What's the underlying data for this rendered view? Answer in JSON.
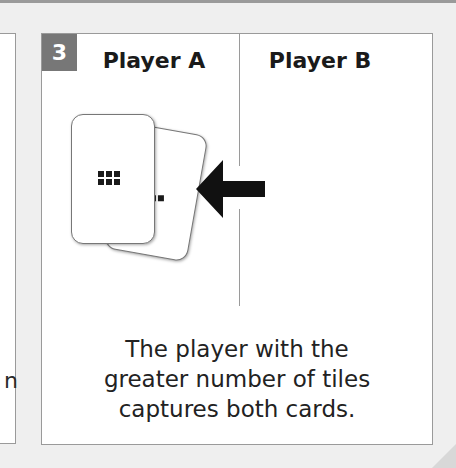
{
  "left_panel": {
    "text_fragment": "n"
  },
  "step": {
    "number": "3"
  },
  "players": {
    "a": "Player A",
    "b": "Player B"
  },
  "cards": {
    "front": {
      "tiles": 6
    },
    "back": {
      "tiles": 2
    }
  },
  "arrow": {
    "direction": "left"
  },
  "caption": {
    "line1": "The player with the",
    "line2": "greater number of tiles",
    "line3": "captures both cards."
  },
  "colors": {
    "badge": "#777777",
    "background": "#efefef",
    "border": "#9a9a9a"
  }
}
